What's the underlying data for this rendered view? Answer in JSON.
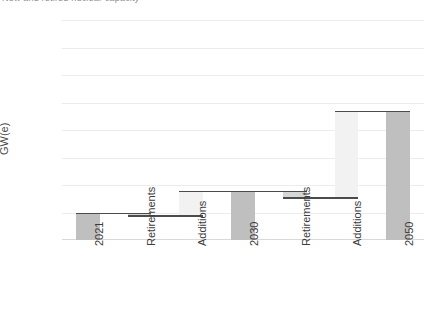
{
  "top_caption": {
    "text": "New and retired nuclear capacity"
  },
  "chart_data": {
    "type": "bar",
    "subtype": "waterfall",
    "title": "",
    "xlabel": "",
    "ylabel": "GW(e)",
    "ylim": [
      0,
      80
    ],
    "ytick_values": [
      0,
      10,
      20,
      30,
      40,
      50,
      60,
      70,
      80
    ],
    "ytick_labels": [
      "0",
      "10",
      "20",
      "30",
      "40",
      "50",
      "60",
      "70",
      "80"
    ],
    "grid": true,
    "legend": "none",
    "categories": [
      "2021",
      "Retirements",
      "Additions",
      "2030",
      "Retirements",
      "Additions",
      "2050"
    ],
    "bars": [
      {
        "label": "2021",
        "kind": "total",
        "base": 0,
        "top": 10,
        "delta": 10,
        "value": 10,
        "color": "#bfbfbf"
      },
      {
        "label": "Retirements",
        "kind": "down",
        "base": 9,
        "top": 10,
        "delta": -1,
        "value": -1,
        "color": "#d6d6d6"
      },
      {
        "label": "Additions",
        "kind": "up",
        "base": 9,
        "top": 18,
        "delta": 9,
        "value": 9,
        "color": "#f2f2f2"
      },
      {
        "label": "2030",
        "kind": "total",
        "base": 0,
        "top": 18,
        "delta": 18,
        "value": 18,
        "color": "#bfbfbf"
      },
      {
        "label": "Retirements",
        "kind": "down",
        "base": 15.5,
        "top": 18,
        "delta": -2.5,
        "value": -2.5,
        "color": "#d6d6d6"
      },
      {
        "label": "Additions",
        "kind": "up",
        "base": 15.5,
        "top": 47,
        "delta": 31.5,
        "value": 31.5,
        "color": "#f2f2f2"
      },
      {
        "label": "2050",
        "kind": "total",
        "base": 0,
        "top": 47,
        "delta": 47,
        "value": 47,
        "color": "#bfbfbf"
      }
    ],
    "connectors": [
      {
        "from_bar": 0,
        "to_bar": 1,
        "level": 10
      },
      {
        "from_bar": 1,
        "to_bar": 2,
        "level": 9
      },
      {
        "from_bar": 2,
        "to_bar": 3,
        "level": 18
      },
      {
        "from_bar": 3,
        "to_bar": 4,
        "level": 18
      },
      {
        "from_bar": 4,
        "to_bar": 5,
        "level": 15.5
      },
      {
        "from_bar": 5,
        "to_bar": 6,
        "level": 47
      }
    ],
    "colors": {
      "total_bar": "#bfbfbf",
      "increase_bar": "#f2f2f2",
      "decrease_bar": "#d6d6d6",
      "connector_line": "#4c4c4c",
      "gridline": "#ececec",
      "text": "#3c3c3c",
      "background": "#ffffff"
    }
  }
}
